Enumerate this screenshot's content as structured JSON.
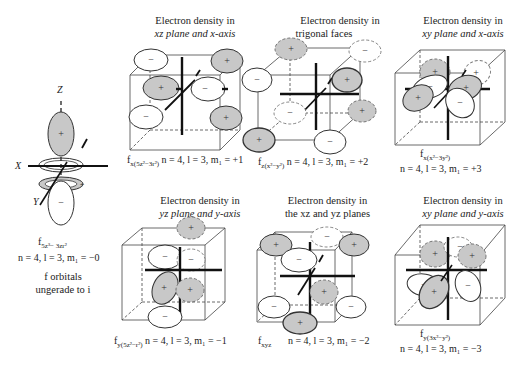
{
  "left_panel": {
    "axis_labels": {
      "z": "Z",
      "x": "X",
      "y": "Y"
    },
    "orbital_label": "f",
    "orbital_subscript": "5z³− 3zr²",
    "quantum_numbers": "n = 4, l = 3, m₁ = −0",
    "note_line1": "f orbitals",
    "note_line2": "ungerade to i"
  },
  "panels": [
    {
      "title1": "Electron density in",
      "title2": "xz plane and x-axis",
      "orbital": "f",
      "sub": "x(5z²−3r²)",
      "qn": "n = 4, l = 3, m₁ = +1"
    },
    {
      "title1": "Electron density in",
      "title2": "trigonal faces",
      "orbital": "f",
      "sub": "z(x²−y²)",
      "qn": "n = 4, l = 3, m₁ = +2"
    },
    {
      "title1": "Electron density in",
      "title2": "xy plane and x-axis",
      "orbital": "f",
      "sub": "x(x²−3y²)",
      "qn": "n = 4, l = 3, m₁ = +3"
    },
    {
      "title1": "Electron density in",
      "title2": "yz plane and y-axis",
      "orbital": "f",
      "sub": "y(5z²−r²)",
      "qn": "n = 4, l = 3, m₁ = −1"
    },
    {
      "title1": "Electron density in",
      "title2": "the xz and yz planes",
      "orbital": "f",
      "sub": "xyz",
      "qn": "n = 4, l = 3, m₁ = −2"
    },
    {
      "title1": "Electron density in",
      "title2": "xy plane and y-axis",
      "orbital": "f",
      "sub": "y(3x²−y²)",
      "qn": "n = 4, l = 3, m₁ = −3"
    }
  ],
  "signs": {
    "plus": "+",
    "minus": "−"
  },
  "colors": {
    "lobe_positive": "#c8c8c8",
    "lobe_negative": "#ffffff",
    "line": "#222222"
  }
}
